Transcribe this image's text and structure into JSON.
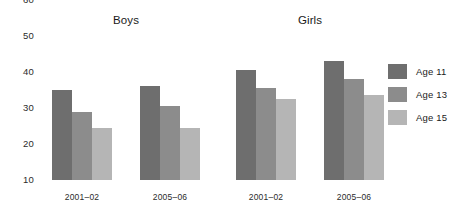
{
  "chart_data": {
    "type": "bar",
    "title": "",
    "xlabel": "",
    "ylabel": "",
    "ylim": [
      10,
      60
    ],
    "yticks": [
      10,
      20,
      30,
      40,
      50,
      60
    ],
    "grid": false,
    "legend_position": "right",
    "panels": [
      {
        "title": "Boys",
        "categories": [
          "2001–02",
          "2005–06"
        ],
        "series": [
          {
            "name": "Age 11",
            "values": [
              35,
              36
            ]
          },
          {
            "name": "Age 13",
            "values": [
              29,
              30.5
            ]
          },
          {
            "name": "Age 15",
            "values": [
              24.5,
              24.5
            ]
          }
        ]
      },
      {
        "title": "Girls",
        "categories": [
          "2001–02",
          "2005–06"
        ],
        "series": [
          {
            "name": "Age 11",
            "values": [
              40.5,
              43
            ]
          },
          {
            "name": "Age 13",
            "values": [
              35.5,
              38
            ]
          },
          {
            "name": "Age 15",
            "values": [
              32.5,
              33.5
            ]
          }
        ]
      }
    ],
    "legend": [
      {
        "name": "Age 11",
        "color": "#6e6e6e"
      },
      {
        "name": "Age 13",
        "color": "#8c8c8c"
      },
      {
        "name": "Age 15",
        "color": "#b5b5b5"
      }
    ]
  }
}
